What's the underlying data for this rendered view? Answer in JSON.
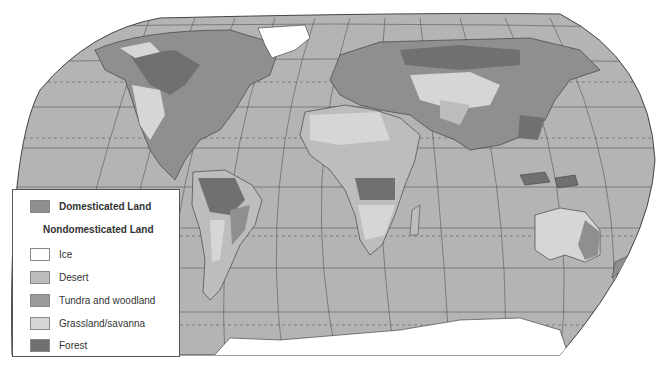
{
  "figure": {
    "type": "world-map",
    "colors": {
      "ocean": "#b4b4b4",
      "domesticated": "#8f8f8f",
      "ice": "#ffffff",
      "desert": "#bdbdbd",
      "tundra": "#9a9a9a",
      "grassland": "#d6d6d6",
      "forest": "#707070",
      "grid": "#555555"
    }
  },
  "legend": {
    "domesticated_label": "Domesticated Land",
    "nondomesticated_heading": "Nondomesticated Land",
    "items": [
      {
        "label": "Ice",
        "color": "#ffffff"
      },
      {
        "label": "Desert",
        "color": "#bdbdbd"
      },
      {
        "label": "Tundra and woodland",
        "color": "#9a9a9a"
      },
      {
        "label": "Grassland/savanna",
        "color": "#d6d6d6"
      },
      {
        "label": "Forest",
        "color": "#707070"
      }
    ]
  }
}
